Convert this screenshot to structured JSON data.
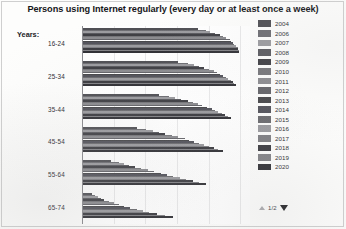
{
  "chart_data": {
    "type": "bar",
    "orientation": "horizontal",
    "title": "Persons using Internet regularly (every day or at least once a week)",
    "xlabel": "",
    "ylabel": "",
    "axis_group_label": "Years:",
    "grid": true,
    "xlim": [
      0,
      100
    ],
    "legend_position": "right",
    "categories": [
      "16-24",
      "25-34",
      "35-44",
      "45-54",
      "55-64",
      "65-74"
    ],
    "series": [
      {
        "name": "2004",
        "color": "#4f4f54",
        "values": [
          72,
          60,
          48,
          34,
          18,
          6
        ]
      },
      {
        "name": "2006",
        "color": "#6d6d72",
        "values": [
          77,
          66,
          54,
          40,
          23,
          8
        ]
      },
      {
        "name": "2007",
        "color": "#9b9b9f",
        "values": [
          80,
          70,
          58,
          44,
          26,
          10
        ]
      },
      {
        "name": "2008",
        "color": "#5a5a5f",
        "values": [
          83,
          73,
          62,
          48,
          29,
          12
        ]
      },
      {
        "name": "2009",
        "color": "#3e3e43",
        "values": [
          86,
          76,
          66,
          52,
          33,
          14
        ]
      },
      {
        "name": "2010",
        "color": "#757579",
        "values": [
          88,
          79,
          69,
          56,
          37,
          17
        ]
      },
      {
        "name": "2011",
        "color": "#8b8b8f",
        "values": [
          90,
          82,
          72,
          60,
          41,
          20
        ]
      },
      {
        "name": "2012",
        "color": "#636368",
        "values": [
          92,
          84,
          75,
          64,
          45,
          23
        ]
      },
      {
        "name": "2013",
        "color": "#464649",
        "values": [
          93,
          86,
          78,
          67,
          49,
          26
        ]
      },
      {
        "name": "2014",
        "color": "#52525a",
        "values": [
          94,
          88,
          81,
          70,
          53,
          30
        ]
      },
      {
        "name": "2015",
        "color": "#6a6a6e",
        "values": [
          95,
          90,
          83,
          73,
          57,
          34
        ]
      },
      {
        "name": "2016",
        "color": "#9a9a9e",
        "values": [
          96,
          91,
          85,
          76,
          61,
          38
        ]
      },
      {
        "name": "2017",
        "color": "#7e7e82",
        "values": [
          97,
          93,
          87,
          79,
          65,
          42
        ]
      },
      {
        "name": "2018",
        "color": "#3a3a3f",
        "values": [
          97,
          94,
          89,
          82,
          69,
          47
        ]
      },
      {
        "name": "2019",
        "color": "#818185",
        "values": [
          98,
          95,
          91,
          85,
          73,
          52
        ]
      },
      {
        "name": "2020",
        "color": "#2f2f34",
        "values": [
          98,
          96,
          93,
          88,
          77,
          57
        ]
      }
    ]
  },
  "legend": {
    "items": [
      {
        "label": "2004"
      },
      {
        "label": "2006"
      },
      {
        "label": "2007"
      },
      {
        "label": "2008"
      },
      {
        "label": "2009"
      },
      {
        "label": "2010"
      },
      {
        "label": "2011"
      },
      {
        "label": "2012"
      },
      {
        "label": "2013"
      },
      {
        "label": "2014"
      },
      {
        "label": "2015"
      },
      {
        "label": "2016"
      },
      {
        "label": "2017"
      },
      {
        "label": "2018"
      },
      {
        "label": "2019"
      },
      {
        "label": "2020"
      }
    ],
    "pager": {
      "page_indicator": "1/2",
      "up_icon": "triangle-up-icon",
      "down_icon": "triangle-down-icon"
    }
  }
}
